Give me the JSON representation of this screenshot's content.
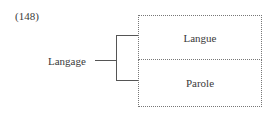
{
  "example_number": "(148)",
  "root": {
    "label": "Langage"
  },
  "branches": [
    {
      "label": "Langue"
    },
    {
      "label": "Parole"
    }
  ],
  "style": {
    "line_color": "#555555",
    "box_border": "dotted",
    "box_border_color": "#777777"
  }
}
